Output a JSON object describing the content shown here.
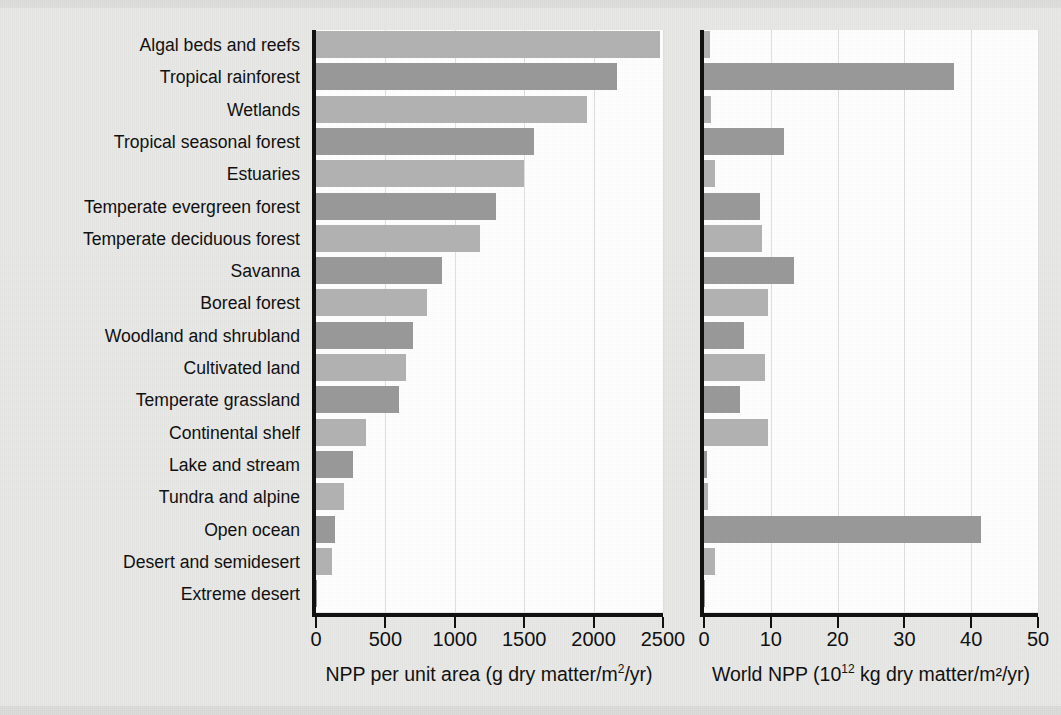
{
  "figure": {
    "background": "#e8e8e6",
    "panel_background": "#ffffff",
    "axis_color": "#111111",
    "gridline_color": "#e0e0e0",
    "bar_color_light": "#b3b3b3",
    "bar_color_dark": "#9a9a9a"
  },
  "axes": {
    "left": {
      "title": "NPP per unit area (g dry matter/m²/yr)",
      "title_plain": "NPP per unit area (g dry matter/m2/yr)",
      "ticks": [
        "0",
        "500",
        "1000",
        "1500",
        "2000",
        "2500"
      ],
      "min": 0,
      "max": 2500
    },
    "right": {
      "title_pre": "World NPP (10",
      "title_sup": "12",
      "title_post": " kg dry matter/m²/yr)",
      "title_plain": "World NPP (10¹² kg dry matter/m²/yr)",
      "ticks": [
        "0",
        "10",
        "20",
        "30",
        "40",
        "50"
      ],
      "min": 0,
      "max": 50
    }
  },
  "chart_data": {
    "type": "bar",
    "orientation": "horizontal",
    "title": "",
    "subtitle": "",
    "grid": true,
    "legend": "none",
    "categories": [
      "Algal beds and reefs",
      "Tropical rainforest",
      "Wetlands",
      "Tropical seasonal forest",
      "Estuaries",
      "Temperate evergreen forest",
      "Temperate deciduous forest",
      "Savanna",
      "Boreal forest",
      "Woodland and shrubland",
      "Cultivated land",
      "Temperate grassland",
      "Continental shelf",
      "Lake and stream",
      "Tundra and alpine",
      "Open ocean",
      "Desert and semidesert",
      "Extreme desert"
    ],
    "series": [
      {
        "name": "NPP per unit area (g dry matter/m²/yr)",
        "panel": "left",
        "xlabel": "NPP per unit area (g dry matter/m²/yr)",
        "xlim": [
          0,
          2500
        ],
        "values": [
          2480,
          2170,
          1950,
          1570,
          1500,
          1300,
          1180,
          910,
          800,
          700,
          645,
          600,
          360,
          270,
          200,
          140,
          115,
          3
        ]
      },
      {
        "name": "World NPP (10¹² kg dry matter/m²/yr)",
        "panel": "right",
        "xlabel": "World NPP (10¹² kg dry matter/m²/yr)",
        "xlim": [
          0,
          50
        ],
        "values": [
          0.9,
          37.4,
          1.1,
          12.0,
          1.6,
          8.4,
          8.7,
          13.5,
          9.6,
          6.0,
          9.1,
          5.4,
          9.6,
          0.5,
          0.6,
          41.5,
          1.6,
          0.07
        ]
      }
    ]
  }
}
